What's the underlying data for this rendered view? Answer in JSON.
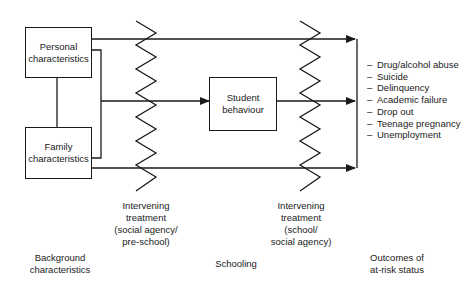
{
  "diagram": {
    "boxes": {
      "personal": "Personal characteristics",
      "family": "Family characteristics",
      "student": "Student behaviour"
    },
    "interventions": [
      {
        "line1": "Intervening",
        "line2": "treatment",
        "line3": "(social agency/",
        "line4": "pre-school)"
      },
      {
        "line1": "Intervening",
        "line2": "treatment",
        "line3": "(school/",
        "line4": "social agency)"
      }
    ],
    "stages": {
      "background": {
        "line1": "Background",
        "line2": "characteristics"
      },
      "schooling": {
        "line1": "Schooling"
      },
      "outcomes": {
        "line1": "Outcomes of",
        "line2": "at-risk status"
      }
    },
    "outcome_list": [
      "Drug/alcohol abuse",
      "Suicide",
      "Delinquency",
      "Academic failure",
      "Drop out",
      "Teenage pregnancy",
      "Unemployment"
    ],
    "bullet": "–",
    "colors": {
      "line": "#1a1a1a",
      "background": "#ffffff"
    }
  }
}
